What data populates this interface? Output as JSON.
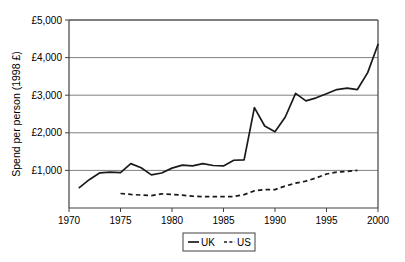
{
  "chart_data": {
    "type": "line",
    "title": "",
    "xlabel": "",
    "ylabel": "Spend per person (1998 £)",
    "xlim": [
      1970,
      2000
    ],
    "ylim": [
      0,
      5000
    ],
    "grid": true,
    "legend_position": "bottom",
    "x_tick_labels": [
      "1970",
      "1975",
      "1980",
      "1985",
      "1990",
      "1995",
      "2000"
    ],
    "x_ticks": [
      1970,
      1975,
      1980,
      1985,
      1990,
      1995,
      2000
    ],
    "y_tick_labels": [
      "£1,000",
      "£2,000",
      "£3,000",
      "£4,000",
      "£5,000"
    ],
    "y_ticks": [
      1000,
      2000,
      3000,
      4000,
      5000
    ],
    "series": [
      {
        "name": "UK",
        "style": "solid",
        "color": "#1a1a1a",
        "x": [
          1971,
          1972,
          1973,
          1974,
          1975,
          1976,
          1977,
          1978,
          1979,
          1980,
          1981,
          1982,
          1983,
          1984,
          1985,
          1986,
          1987,
          1988,
          1989,
          1990,
          1991,
          1992,
          1993,
          1994,
          1995,
          1996,
          1997,
          1998,
          1999,
          2000
        ],
        "values": [
          540,
          760,
          935,
          955,
          940,
          1180,
          1070,
          880,
          930,
          1060,
          1140,
          1120,
          1180,
          1130,
          1120,
          1270,
          1280,
          2670,
          2180,
          2030,
          2420,
          3050,
          2850,
          2930,
          3040,
          3150,
          3190,
          3150,
          3600,
          4350
        ]
      },
      {
        "name": "US",
        "style": "dashed",
        "color": "#1a1a1a",
        "x": [
          1975,
          1976,
          1977,
          1978,
          1979,
          1980,
          1981,
          1982,
          1983,
          1984,
          1985,
          1986,
          1987,
          1988,
          1989,
          1990,
          1991,
          1992,
          1993,
          1994,
          1995,
          1996,
          1997,
          1998
        ],
        "values": [
          385,
          360,
          345,
          330,
          375,
          360,
          340,
          315,
          300,
          300,
          300,
          305,
          355,
          455,
          490,
          490,
          585,
          660,
          715,
          800,
          905,
          955,
          975,
          1000
        ]
      }
    ]
  },
  "legend": {
    "items": [
      {
        "label": "UK",
        "style": "solid"
      },
      {
        "label": "US",
        "style": "dashed"
      }
    ]
  }
}
